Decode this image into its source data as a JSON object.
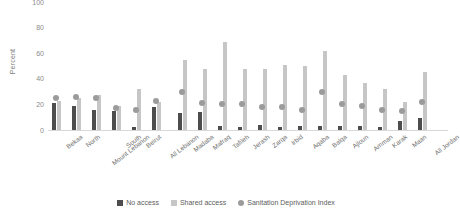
{
  "chart": {
    "ylabel": "Percent",
    "yticks": [
      0,
      20,
      40,
      60,
      80,
      100
    ],
    "legend": [
      {
        "key": "no_access",
        "label": "No access",
        "marker": "square-dark-icon",
        "color": "#4d4d4d"
      },
      {
        "key": "shared_access",
        "label": "Shared access",
        "marker": "square-light-icon",
        "color": "#c6c6c6"
      },
      {
        "key": "sdi",
        "label": "Sanitation Deprivation Index",
        "marker": "circle-gray-icon",
        "color": "#9b9b9b"
      }
    ]
  },
  "chart_data": {
    "type": "bar",
    "title": "",
    "xlabel": "",
    "ylabel": "Percent",
    "ylim": [
      0,
      100
    ],
    "yticks": [
      0,
      20,
      40,
      60,
      80,
      100
    ],
    "grid": false,
    "legend_position": "bottom",
    "categories": [
      "Bekaa",
      "North",
      "Mount Lebanon",
      "South",
      "Beirut",
      "All Lebanon",
      "Madaba",
      "Mafraq",
      "Tafileh",
      "Jerash",
      "Zarqa",
      "Irbid",
      "Aqaba",
      "Balqa",
      "Ajloun",
      "Amman",
      "Karak",
      "Maan",
      "All Jordan"
    ],
    "series": [
      {
        "name": "No access",
        "color": "#4d4d4d",
        "type": "bar",
        "values": [
          21,
          19,
          16,
          15,
          2,
          18,
          13,
          14,
          3,
          2,
          4,
          2,
          3,
          3,
          3,
          3,
          2,
          7,
          9
        ]
      },
      {
        "name": "Shared access",
        "color": "#c6c6c6",
        "type": "bar",
        "values": [
          23,
          25,
          27,
          19,
          32,
          22,
          55,
          48,
          69,
          48,
          48,
          51,
          50,
          62,
          43,
          37,
          32,
          22,
          45
        ]
      },
      {
        "name": "Sanitation Deprivation Index",
        "color": "#9b9b9b",
        "type": "scatter",
        "values": [
          25,
          26,
          25,
          17,
          16,
          23,
          30,
          21,
          20,
          20,
          18,
          18,
          16,
          30,
          20,
          19,
          16,
          15,
          22
        ]
      }
    ]
  }
}
